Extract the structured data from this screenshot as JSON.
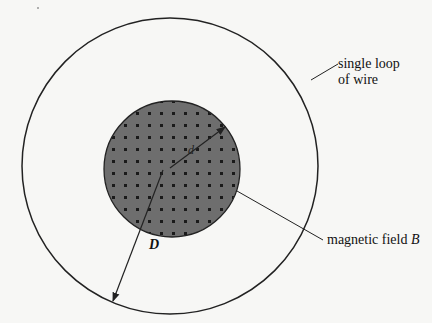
{
  "figure": {
    "type": "physics-diagram",
    "labels": {
      "loop_line1": "single loop",
      "loop_line2": "of wire",
      "field_text": "magnetic field ",
      "field_symbol": "B",
      "inner_dim": "d",
      "outer_dim": "D"
    },
    "colors": {
      "background": "#f7f7f5",
      "stroke": "#222222",
      "field_fill": "#6e6e6e",
      "dot": "#1a1a1a"
    }
  }
}
